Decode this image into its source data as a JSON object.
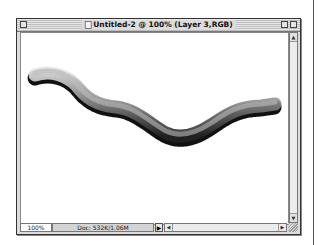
{
  "window": {
    "title": "Untitled-2 @ 100% (Layer 3,RGB)",
    "icons": {
      "close": "close-box-icon",
      "document": "document-icon",
      "zoom": "zoom-box-icon",
      "collapse": "collapse-box-icon"
    }
  },
  "canvas": {
    "stroke": {
      "description": "gray gradient brush stroke, light on top, dark on bottom, scalloped edges",
      "color_light": "#d8d8d8",
      "color_dark": "#111111"
    }
  },
  "statusbar": {
    "zoom": "100%",
    "doc_info": "Doc: 532K/1.06M",
    "menu_arrow": "▶"
  },
  "scrollbars": {
    "up": "▲",
    "down": "▼",
    "left": "◀",
    "right": "▶"
  }
}
